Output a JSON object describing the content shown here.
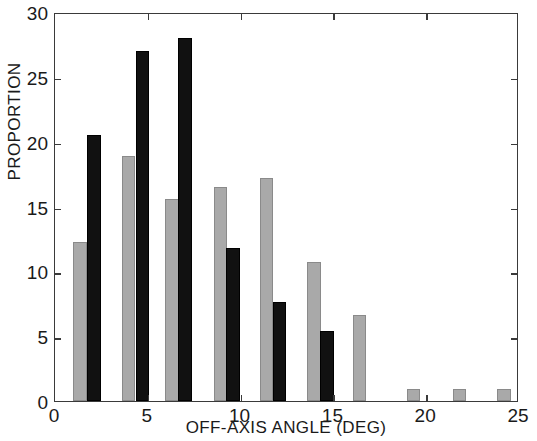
{
  "chart_data": {
    "type": "bar",
    "title": "",
    "xlabel": "OFF-AXIS ANGLE (DEG)",
    "ylabel": "PROPORTION",
    "xlim": [
      0,
      25
    ],
    "ylim": [
      0,
      30
    ],
    "xticks": [
      0,
      5,
      10,
      15,
      20,
      25
    ],
    "xtick_labels": [
      "0",
      "5",
      "10",
      "15",
      "20",
      "25"
    ],
    "yticks": [
      0,
      5,
      10,
      15,
      20,
      25,
      30
    ],
    "ytick_labels": [
      "0",
      "5",
      "10",
      "15",
      "20",
      "25",
      "30"
    ],
    "grid": false,
    "legend": "none",
    "bar_width_deg": 0.72,
    "colors": {
      "series_gray": "#a9a9a9",
      "series_black": "#111111",
      "axis": "#3a3a3a",
      "text": "#1a1a1a",
      "background": "#ffffff"
    },
    "series": [
      {
        "name": "series-gray",
        "color": "#a9a9a9",
        "x": [
          1.35,
          3.95,
          6.3,
          8.9,
          11.4,
          13.95,
          16.4,
          19.3,
          21.8,
          24.2
        ],
        "values": [
          12.3,
          18.9,
          15.6,
          16.5,
          17.2,
          10.7,
          6.6,
          0.9,
          0.9,
          0.9
        ]
      },
      {
        "name": "series-black",
        "color": "#111111",
        "x": [
          2.1,
          4.7,
          7.0,
          9.6,
          12.1,
          14.65
        ],
        "values": [
          20.5,
          27.0,
          28.0,
          11.8,
          7.6,
          5.4
        ]
      }
    ]
  }
}
